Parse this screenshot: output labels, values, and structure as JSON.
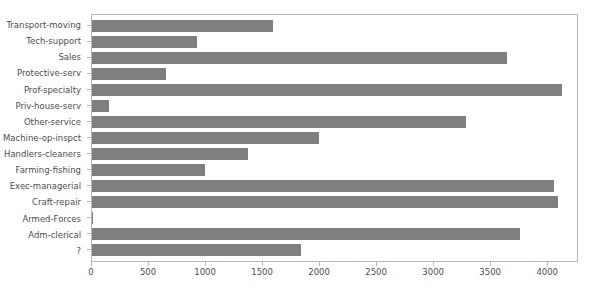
{
  "chart_data": {
    "type": "bar",
    "orientation": "horizontal",
    "title": "",
    "xlabel": "",
    "ylabel": "",
    "xlim": [
      0,
      4270
    ],
    "xticks": [
      0,
      500,
      1000,
      1500,
      2000,
      2500,
      3000,
      3500,
      4000
    ],
    "xticklabels": [
      "0",
      "500",
      "1000",
      "1500",
      "2000",
      "2500",
      "3000",
      "3500",
      "4000"
    ],
    "grid": false,
    "legend": false,
    "bar_color": "#7f7f7f",
    "categories": [
      "Transport-moving",
      "Tech-support",
      "Sales",
      "Protective-serv",
      "Prof-specialty",
      "Priv-house-serv",
      "Other-service",
      "Machine-op-inspct",
      "Handlers-cleaners",
      "Farming-fishing",
      "Exec-managerial",
      "Craft-repair",
      "Armed-Forces",
      "Adm-clerical",
      "?"
    ],
    "values": [
      1597,
      928,
      3650,
      649,
      4140,
      149,
      3295,
      2002,
      1370,
      994,
      4066,
      4099,
      9,
      3770,
      1843
    ]
  }
}
